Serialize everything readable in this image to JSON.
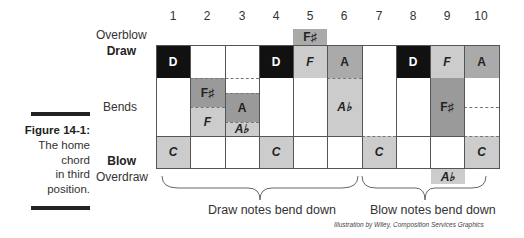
{
  "holes": [
    "1",
    "2",
    "3",
    "4",
    "5",
    "6",
    "7",
    "8",
    "9",
    "10"
  ],
  "row_labels": {
    "overblow": "Overblow",
    "draw": "Draw",
    "bends": "Bends",
    "blow": "Blow",
    "overdraw": "Overdraw"
  },
  "caption": {
    "title": "Figure 14-1:",
    "line1": "The home",
    "line2": "chord",
    "line3": "in third",
    "line4": "position."
  },
  "overblow": {
    "hole": 5,
    "note": "F♯"
  },
  "draw": [
    "D",
    "",
    "",
    "D",
    "F",
    "A",
    "",
    "D",
    "F",
    "A"
  ],
  "bends": {
    "hole2": [
      "F♯",
      "F"
    ],
    "hole3": [
      "A",
      "A♭"
    ],
    "hole6": "A♭",
    "hole9": "F♯"
  },
  "blow": [
    "C",
    "",
    "",
    "C",
    "",
    "",
    "C",
    "",
    "",
    "C"
  ],
  "overdraw": {
    "hole": 9,
    "note": "A♭"
  },
  "braces": {
    "left": "Draw notes bend down",
    "right": "Blow notes bend down"
  },
  "credit": "Illustration by Wiley, Composition Services Graphics",
  "colors": {
    "black": "#111111",
    "dark_gray": "#9a9a9a",
    "medium_gray": "#aaaaaa",
    "light_gray": "#cccccc"
  }
}
